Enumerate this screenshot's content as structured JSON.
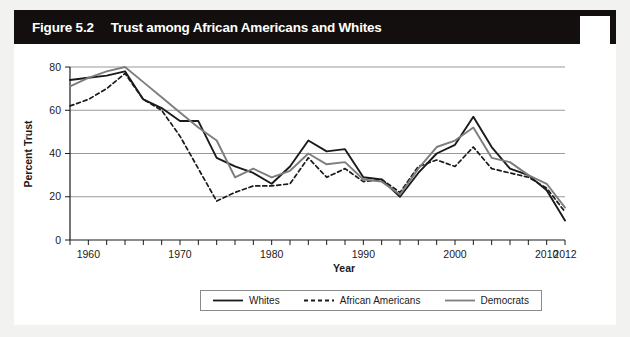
{
  "figure": {
    "number": "Figure 5.2",
    "title": "Trust among African Americans and Whites"
  },
  "colors": {
    "frame": "#120f0e",
    "title_text": "#ffffff",
    "whites_line": "#1a1a1a",
    "african_americans_line": "#1a1a1a",
    "democrats_line": "#7d7d7d",
    "gridline": "#9a9a9a",
    "axis": "#1a1a1a",
    "plot_background": "#ffffff"
  },
  "legend": {
    "position": "bottom-center",
    "entries": [
      {
        "label": "Whites",
        "style": "solid",
        "color": "#1a1a1a"
      },
      {
        "label": "African Americans",
        "style": "dashed",
        "color": "#1a1a1a"
      },
      {
        "label": "Democrats",
        "style": "solid",
        "color": "#7d7d7d"
      }
    ]
  },
  "chart_data": {
    "type": "line",
    "title": "Trust among African Americans and Whites",
    "xlabel": "Year",
    "ylabel": "Percent Trust",
    "xlim": [
      1958,
      2012
    ],
    "ylim": [
      0,
      80
    ],
    "yticks": [
      0,
      20,
      40,
      60,
      80
    ],
    "ytick_labels": [
      "0",
      "20",
      "40",
      "60",
      "80"
    ],
    "xticks": [
      1960,
      1970,
      1980,
      1990,
      2000,
      2010,
      2012
    ],
    "xtick_labels": [
      "1960",
      "1970",
      "1980",
      "1990",
      "2000",
      "2010",
      "2012"
    ],
    "minor_tick_interval": 2,
    "grid": "horizontal",
    "legend_position": "below-axes",
    "x": [
      1958,
      1960,
      1962,
      1964,
      1966,
      1968,
      1970,
      1972,
      1974,
      1976,
      1978,
      1980,
      1982,
      1984,
      1986,
      1988,
      1990,
      1992,
      1994,
      1996,
      1998,
      2000,
      2002,
      2004,
      2006,
      2008,
      2010,
      2012
    ],
    "series": [
      {
        "name": "Whites",
        "style": "solid",
        "color": "#1a1a1a",
        "values": [
          74,
          75,
          76,
          78,
          65,
          61,
          55,
          55,
          38,
          34,
          31,
          26,
          34,
          46,
          41,
          42,
          29,
          28,
          20,
          31,
          40,
          44,
          57,
          43,
          33,
          30,
          23,
          9
        ]
      },
      {
        "name": "African Americans",
        "style": "dashed",
        "color": "#1a1a1a",
        "values": [
          62,
          65,
          70,
          77,
          65,
          60,
          48,
          33,
          18,
          22,
          25,
          25,
          26,
          38,
          29,
          33,
          27,
          28,
          22,
          34,
          37,
          34,
          43,
          33,
          31,
          29,
          24,
          13
        ]
      },
      {
        "name": "Democrats",
        "style": "solid",
        "color": "#7d7d7d",
        "values": [
          71,
          75,
          78,
          80,
          73,
          66,
          59,
          52,
          46,
          29,
          33,
          29,
          32,
          40,
          35,
          36,
          28,
          27,
          21,
          33,
          43,
          46,
          52,
          38,
          36,
          30,
          26,
          15
        ]
      }
    ]
  }
}
